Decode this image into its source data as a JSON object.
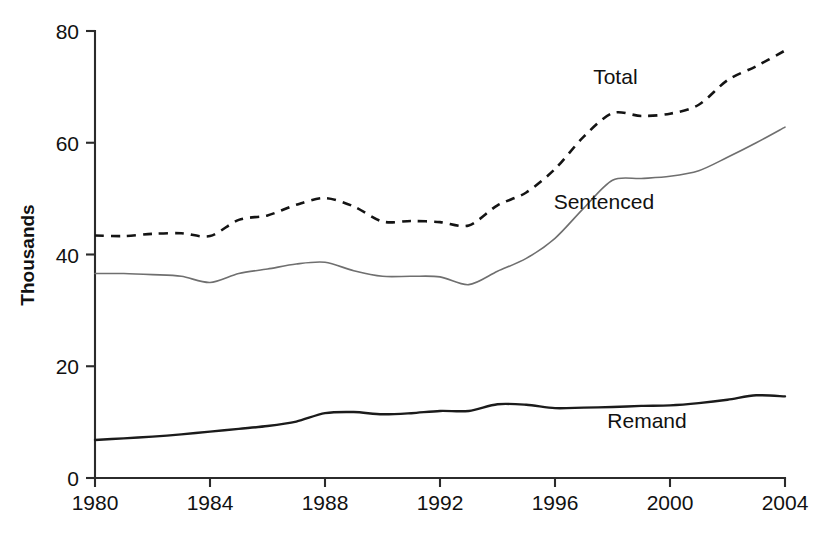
{
  "chart_data": {
    "type": "line",
    "title": "",
    "xlabel": "",
    "ylabel": "Thousands",
    "xlim": [
      1980,
      2004
    ],
    "ylim": [
      0,
      80
    ],
    "ytick_values": [
      0,
      20,
      40,
      60,
      80
    ],
    "ytick_labels": [
      "0",
      "20",
      "40",
      "60",
      "80"
    ],
    "xtick_values": [
      1980,
      1984,
      1988,
      1992,
      1996,
      2000,
      2004
    ],
    "xtick_labels": [
      "1980",
      "1984",
      "1988",
      "1992",
      "1996",
      "2000",
      "2004"
    ],
    "grid": false,
    "legend_position": "inline-annotations",
    "x": [
      1980,
      1981,
      1982,
      1983,
      1984,
      1985,
      1986,
      1987,
      1988,
      1989,
      1990,
      1991,
      1992,
      1993,
      1994,
      1995,
      1996,
      1997,
      1998,
      1999,
      2000,
      2001,
      2002,
      2003,
      2004
    ],
    "series": [
      {
        "name": "Total",
        "style": "dashed",
        "color": "#141414",
        "label": "Total",
        "values": [
          43.4,
          43.3,
          43.7,
          43.8,
          43.3,
          46.2,
          47.0,
          48.9,
          50.1,
          48.6,
          45.9,
          46.0,
          45.8,
          45.2,
          48.8,
          51.1,
          55.3,
          61.1,
          65.3,
          64.8,
          65.2,
          66.8,
          71.2,
          73.7,
          76.5
        ]
      },
      {
        "name": "Sentenced",
        "style": "solid-light",
        "color": "#6f6f6f",
        "label": "Sentenced",
        "values": [
          36.6,
          36.6,
          36.4,
          36.1,
          35.0,
          36.6,
          37.4,
          38.3,
          38.6,
          37.1,
          36.1,
          36.1,
          36.0,
          34.6,
          37.0,
          39.3,
          42.9,
          48.3,
          53.3,
          53.6,
          54.0,
          55.0,
          57.4,
          60.0,
          62.8
        ]
      },
      {
        "name": "Remand",
        "style": "solid-dark",
        "color": "#1b1b1b",
        "label": "Remand",
        "values": [
          6.8,
          7.1,
          7.4,
          7.8,
          8.3,
          8.8,
          9.3,
          10.1,
          11.6,
          11.8,
          11.4,
          11.6,
          12.0,
          12.0,
          13.2,
          13.1,
          12.5,
          12.6,
          12.7,
          12.9,
          13.0,
          13.4,
          14.0,
          14.8,
          14.6
        ]
      }
    ],
    "annotations": [
      {
        "text": "Total",
        "x": 1998.1,
        "y": 70.5
      },
      {
        "text": "Sentenced",
        "x": 1997.7,
        "y": 48.2
      },
      {
        "text": "Remand",
        "x": 1999.2,
        "y": 9.0
      }
    ]
  },
  "axis": {
    "y_title": "Thousands"
  }
}
